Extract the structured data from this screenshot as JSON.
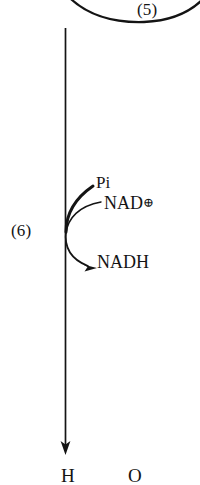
{
  "figure": {
    "type": "reaction-pathway-fragment",
    "background_color": "#ffffff",
    "ink_color": "#141414",
    "width": 200,
    "height": 485
  },
  "steps": {
    "upper_step_label": "(5)",
    "lower_step_label": "(6)"
  },
  "cofactors": {
    "substrate_in": "Pi",
    "oxidized_cofactor": "NAD",
    "oxidized_cofactor_charge": "⊕",
    "reduced_cofactor": "NADH"
  },
  "structure_fragment": {
    "atom_left": "H",
    "atom_right": "O"
  },
  "icons": {
    "reaction-arrow": "downward-reaction-arrow",
    "cofactor-in-arrow": "curved-arrow-in",
    "cofactor-out-arrow": "curved-arrow-out",
    "upper-loop-arc": "reaction-loop-arc"
  }
}
